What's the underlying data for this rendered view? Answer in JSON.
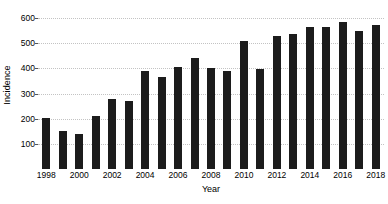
{
  "chart_data": {
    "type": "bar",
    "title": "",
    "xlabel": "Year",
    "ylabel": "Incidence",
    "categories": [
      "1998",
      "1999",
      "2000",
      "2001",
      "2002",
      "2003",
      "2004",
      "2005",
      "2006",
      "2007",
      "2008",
      "2009",
      "2010",
      "2011",
      "2012",
      "2013",
      "2014",
      "2015",
      "2016",
      "2017",
      "2018"
    ],
    "values": [
      203,
      150,
      140,
      210,
      277,
      270,
      390,
      365,
      405,
      440,
      400,
      389,
      507,
      398,
      530,
      538,
      565,
      563,
      585,
      548,
      574
    ],
    "series": [
      {
        "name": "Incidence",
        "values": [
          203,
          150,
          140,
          210,
          277,
          270,
          390,
          365,
          405,
          440,
          400,
          389,
          507,
          398,
          530,
          538,
          565,
          563,
          585,
          548,
          574
        ]
      }
    ],
    "ylim": [
      0,
      640
    ],
    "xlim": [
      1997.5,
      2018.5
    ],
    "y_ticks": [
      100,
      200,
      300,
      400,
      500,
      600
    ],
    "y_tick_labels": [
      "100",
      "200",
      "300",
      "400",
      "500",
      "600"
    ],
    "x_ticks": [
      1998,
      2000,
      2002,
      2004,
      2006,
      2008,
      2010,
      2012,
      2014,
      2016,
      2018
    ],
    "x_tick_labels": [
      "1998",
      "2000",
      "2002",
      "2004",
      "2006",
      "2008",
      "2010",
      "2012",
      "2014",
      "2016",
      "2018"
    ],
    "grid": "horizontal-dotted",
    "legend": "none",
    "bar_color": "#1c1c1c",
    "grid_color": "#c3c3c3",
    "background_color": "#ffffff"
  }
}
